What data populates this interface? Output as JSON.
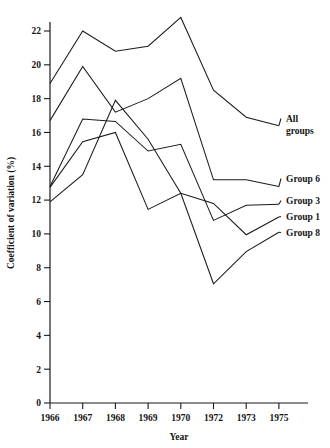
{
  "chart_data": {
    "type": "line",
    "title": "",
    "xlabel": "Year",
    "ylabel": "Coefficient of variation (%)",
    "categories": [
      "1966",
      "1967",
      "1968",
      "1969",
      "1970",
      "1972",
      "1973",
      "1975"
    ],
    "x_tick_labels": [
      "1966",
      "1967",
      "1968",
      "1969",
      "1970",
      "1972",
      "1973",
      "1975"
    ],
    "y_tick_labels": [
      "0",
      "2",
      "4",
      "6",
      "8",
      "10",
      "12",
      "14",
      "16",
      "18",
      "20",
      "22"
    ],
    "y_ticks": [
      0,
      2,
      4,
      6,
      8,
      10,
      12,
      14,
      16,
      18,
      20,
      22
    ],
    "ylim": [
      0,
      23.6
    ],
    "grid": false,
    "legend_position": "right-inline",
    "series": [
      {
        "name": "All groups",
        "label": "All",
        "label_line2": "groups",
        "values": [
          18.9,
          22.0,
          20.8,
          21.1,
          22.8,
          18.5,
          16.9,
          16.4
        ]
      },
      {
        "name": "Group 6",
        "label": "Group 6",
        "label_line2": "",
        "values": [
          16.7,
          19.9,
          17.2,
          18.0,
          19.2,
          13.2,
          13.2,
          12.8
        ]
      },
      {
        "name": "Group 3",
        "label": "Group 3",
        "label_line2": "",
        "values": [
          12.8,
          16.8,
          16.65,
          14.9,
          15.3,
          10.8,
          11.7,
          11.75
        ]
      },
      {
        "name": "Group 1",
        "label": "Group 1",
        "label_line2": "",
        "values": [
          12.75,
          15.45,
          16.0,
          11.45,
          12.4,
          11.8,
          9.95,
          11.0
        ]
      },
      {
        "name": "Group 8",
        "label": "Group 8",
        "label_line2": "",
        "values": [
          11.9,
          13.5,
          17.9,
          15.6,
          12.4,
          7.05,
          8.95,
          10.1
        ]
      }
    ],
    "legend_labels": [
      "All groups",
      "Group 6",
      "Group 3",
      "Group 1",
      "Group 8"
    ],
    "colors": {
      "line": "#1a1a1a",
      "axis": "#1a1a1a",
      "text": "#141414",
      "background": "#ffffff"
    }
  }
}
